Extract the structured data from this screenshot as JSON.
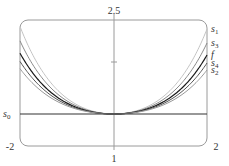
{
  "chart_data": {
    "type": "line",
    "title": "",
    "xlabel": "",
    "ylabel": "",
    "x_tick_labels": {
      "left": "-2",
      "center": "1",
      "right": "2"
    },
    "y_tick_labels": {
      "top": "2.5"
    },
    "grid": false,
    "legend_position": "right (inline labels at curve ends)",
    "series": [
      {
        "name": "s1",
        "label_main": "s",
        "label_sub": "1",
        "color": "#c4c4c4",
        "end_y_px": 29,
        "k": 0.0093
      },
      {
        "name": "s3",
        "label_main": "s",
        "label_sub": "3",
        "color": "#8a8a8a",
        "end_y_px": 43,
        "k": 0.0105
      },
      {
        "name": "f",
        "label_main": "f",
        "label_sub": "",
        "color": "#1a1a1a",
        "end_y_px": 55,
        "k": 0.0118
      },
      {
        "name": "s4",
        "label_main": "s",
        "label_sub": "4",
        "color": "#555555",
        "end_y_px": 63,
        "k": 0.0128
      },
      {
        "name": "s2",
        "label_main": "s",
        "label_sub": "2",
        "color": "#9a9a9a",
        "end_y_px": 70,
        "k": 0.014
      },
      {
        "name": "s0",
        "label_main": "s",
        "label_sub": "0",
        "color": "#333333",
        "constant": true
      }
    ]
  }
}
